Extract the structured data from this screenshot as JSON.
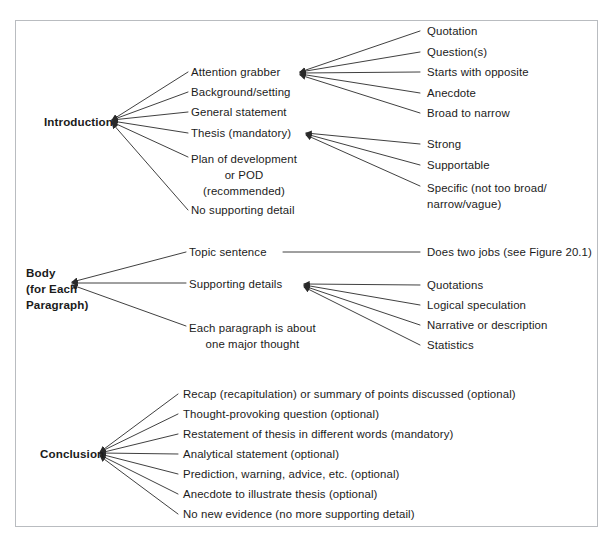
{
  "figure": {
    "frame_color": "#b9bcc0",
    "line_color": "#2a2a2a",
    "text_color": "#1b1b1b"
  },
  "sections": {
    "introduction": {
      "label": "Introduction",
      "children": [
        "Attention grabber",
        "Background/setting",
        "General statement",
        "Thesis (mandatory)",
        "Plan of development\nor POD\n(recommended)",
        "No supporting detail"
      ],
      "attention_grabber_children": [
        "Quotation",
        "Question(s)",
        "Starts with opposite",
        "Anecdote",
        "Broad to narrow"
      ],
      "thesis_children": [
        "Strong",
        "Supportable",
        "Specific (not too broad/\nnarrow/vague)"
      ]
    },
    "body": {
      "label": "Body\n(for Each\nParagraph)",
      "children": [
        "Topic sentence",
        "Supporting details",
        "Each paragraph is about\none major thought"
      ],
      "topic_sentence_children": [
        "Does two jobs (see Figure 20.1)"
      ],
      "supporting_details_children": [
        "Quotations",
        "Logical speculation",
        "Narrative or description",
        "Statistics"
      ]
    },
    "conclusion": {
      "label": "Conclusion",
      "children": [
        "Recap (recapitulation) or summary of points discussed (optional)",
        "Thought-provoking question (optional)",
        "Restatement of thesis in different words (mandatory)",
        "Analytical statement (optional)",
        "Prediction, warning, advice, etc. (optional)",
        "Anecdote to illustrate thesis (optional)",
        "No new evidence (no more supporting detail)"
      ]
    }
  }
}
